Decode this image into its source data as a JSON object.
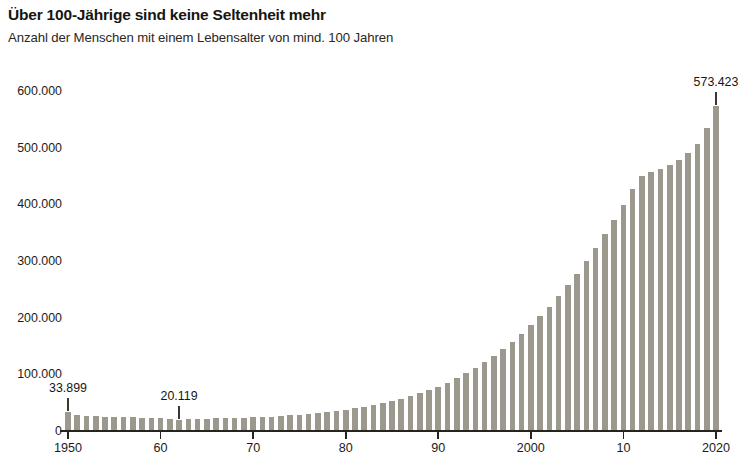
{
  "header": {
    "title": "Über 100-Jährige sind keine Seltenheit mehr",
    "subtitle": "Anzahl der Menschen mit einem Lebensalter von mind. 100 Jahren"
  },
  "chart_data": {
    "type": "bar",
    "title": "Über 100-Jährige sind keine Seltenheit mehr",
    "subtitle": "Anzahl der Menschen mit einem Lebensalter von mind. 100 Jahren",
    "xlabel": "",
    "ylabel": "",
    "ylim": [
      0,
      640000
    ],
    "xlim": [
      1949.5,
      2020.5
    ],
    "grid": false,
    "legend": null,
    "bar_color": "#9c988e",
    "axis_color": "#26241f",
    "background": "#ffffff",
    "ytick_labels": [
      "0",
      "100.000",
      "200.000",
      "300.000",
      "400.000",
      "500.000",
      "600.000"
    ],
    "ytick_values": [
      0,
      100000,
      200000,
      300000,
      400000,
      500000,
      600000
    ],
    "xtick_labels": [
      "1950",
      "60",
      "70",
      "80",
      "90",
      "2000",
      "10",
      "2020"
    ],
    "xtick_values": [
      1950,
      1960,
      1970,
      1980,
      1990,
      2000,
      2010,
      2020
    ],
    "annotations": [
      {
        "label": "33.899",
        "x": 1950,
        "value": 33899
      },
      {
        "label": "20.119",
        "x": 1962,
        "value": 20119
      },
      {
        "label": "573.423",
        "x": 2020,
        "value": 573423
      }
    ],
    "categories": [
      1950,
      1951,
      1952,
      1953,
      1954,
      1955,
      1956,
      1957,
      1958,
      1959,
      1960,
      1961,
      1962,
      1963,
      1964,
      1965,
      1966,
      1967,
      1968,
      1969,
      1970,
      1971,
      1972,
      1973,
      1974,
      1975,
      1976,
      1977,
      1978,
      1979,
      1980,
      1981,
      1982,
      1983,
      1984,
      1985,
      1986,
      1987,
      1988,
      1989,
      1990,
      1991,
      1992,
      1993,
      1994,
      1995,
      1996,
      1997,
      1998,
      1999,
      2000,
      2001,
      2002,
      2003,
      2004,
      2005,
      2006,
      2007,
      2008,
      2009,
      2010,
      2011,
      2012,
      2013,
      2014,
      2015,
      2016,
      2017,
      2018,
      2019,
      2020
    ],
    "values": [
      33899,
      28500,
      26800,
      25900,
      25200,
      24800,
      24500,
      24000,
      23500,
      23000,
      22400,
      21500,
      20119,
      20900,
      21400,
      21800,
      22200,
      22500,
      22900,
      23300,
      23900,
      24600,
      25500,
      26500,
      27600,
      28800,
      30200,
      31700,
      33400,
      35300,
      37400,
      39800,
      42500,
      45500,
      48800,
      52500,
      56600,
      61200,
      66300,
      72000,
      78400,
      85500,
      93300,
      101900,
      111300,
      121500,
      132600,
      144600,
      157500,
      171400,
      186300,
      202300,
      219400,
      237700,
      257100,
      277700,
      299500,
      322500,
      346800,
      372300,
      399000,
      426900,
      450600,
      456000,
      462000,
      470000,
      478000,
      490000,
      506000,
      535000,
      573423
    ]
  }
}
